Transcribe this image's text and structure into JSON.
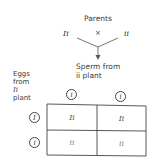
{
  "diagram": {
    "title": "Parents",
    "cross_symbol": "×",
    "parent_left": "Ii",
    "parent_right": "ii",
    "sperm_label_line1": "Sperm from",
    "sperm_label_line2": "ii plant",
    "eggs_label": [
      "Eggs",
      "from",
      "Ii",
      "plant"
    ],
    "sperm_alleles": [
      "i",
      "i"
    ],
    "egg_alleles": [
      "I",
      "i"
    ],
    "punnett_square": [
      [
        "Ii",
        "Ii"
      ],
      [
        "ii",
        "ii"
      ]
    ],
    "line_color": "#444444"
  }
}
